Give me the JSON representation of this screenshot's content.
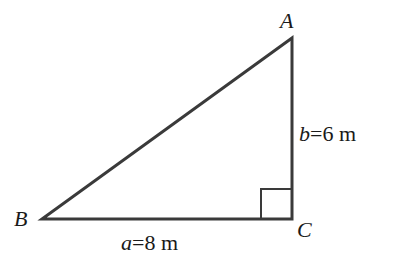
{
  "diagram": {
    "type": "right-triangle",
    "colors": {
      "stroke": "#3a3a3a",
      "text": "#1a1a1a",
      "background": "#ffffff"
    },
    "vertices": {
      "A": {
        "label": "A",
        "x": 292,
        "y": 38
      },
      "B": {
        "label": "B",
        "x": 42,
        "y": 219
      },
      "C": {
        "label": "C",
        "x": 292,
        "y": 219
      }
    },
    "right_angle_at": "C",
    "sides": {
      "a": {
        "var": "a",
        "eq": "=8 m",
        "value": 8,
        "unit": "m",
        "between": "B-C"
      },
      "b": {
        "var": "b",
        "eq": "=6 m",
        "value": 6,
        "unit": "m",
        "between": "A-C"
      }
    }
  }
}
